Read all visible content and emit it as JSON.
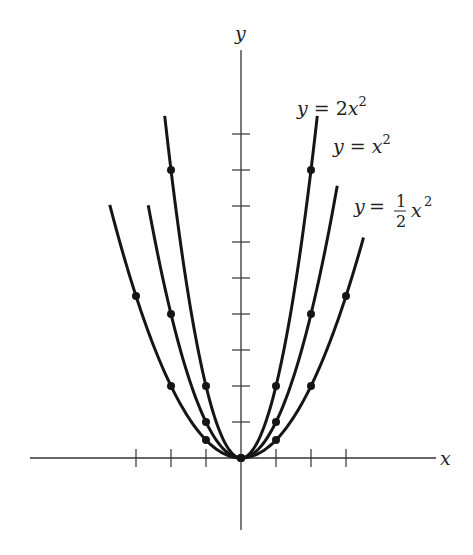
{
  "chart_data": {
    "type": "line",
    "title": "",
    "xlabel": "x",
    "ylabel": "y",
    "grid": false,
    "legend": "inline labels at curve ends",
    "x_ticks": [
      -3,
      -2,
      -1,
      1,
      2,
      3
    ],
    "y_ticks": [
      1,
      2,
      3,
      4,
      5,
      6,
      7,
      8,
      9
    ],
    "xlim": [
      -6,
      5.6
    ],
    "ylim": [
      -2,
      12.5
    ],
    "series": [
      {
        "name": "y = 2x^2",
        "label_parts": {
          "lhs": "y",
          "eq": "=",
          "coef": "2",
          "var": "x",
          "exp": "2"
        },
        "coefficient": 2,
        "x_range": [
          -2.18,
          2.18
        ],
        "points": [
          [
            -2,
            8
          ],
          [
            -1,
            2
          ],
          [
            0,
            0
          ],
          [
            1,
            2
          ],
          [
            2,
            8
          ]
        ]
      },
      {
        "name": "y = x^2",
        "label_parts": {
          "lhs": "y",
          "eq": "=",
          "coef": "",
          "var": "x",
          "exp": "2"
        },
        "coefficient": 1,
        "x_range": [
          -2.65,
          2.75
        ],
        "points": [
          [
            -2,
            4
          ],
          [
            -1,
            1
          ],
          [
            0,
            0
          ],
          [
            1,
            1
          ],
          [
            2,
            4
          ]
        ]
      },
      {
        "name": "y = (1/2)x^2",
        "label_parts": {
          "lhs": "y",
          "eq": "=",
          "num": "1",
          "den": "2",
          "var": "x",
          "exp": "2"
        },
        "coefficient": 0.5,
        "x_range": [
          -3.75,
          3.5
        ],
        "points": [
          [
            -3,
            4.5
          ],
          [
            -2,
            2
          ],
          [
            -1,
            0.5
          ],
          [
            0,
            0
          ],
          [
            1,
            0.5
          ],
          [
            2,
            2
          ],
          [
            3,
            4.5
          ]
        ]
      }
    ]
  },
  "axes": {
    "x_label": "x",
    "y_label": "y"
  },
  "labels": {
    "two_x2": {
      "lhs": "y",
      "eq": "=",
      "coef": "2x",
      "exp": "2"
    },
    "x2": {
      "lhs": "y",
      "eq": "=",
      "coef": "x",
      "exp": "2"
    },
    "half_x2": {
      "lhs": "y",
      "eq": "=",
      "num": "1",
      "den": "2",
      "var": "x",
      "exp": "2"
    }
  },
  "layout": {
    "origin_px": [
      241,
      458
    ],
    "unit_x_px": 35,
    "unit_y_px": 36
  }
}
